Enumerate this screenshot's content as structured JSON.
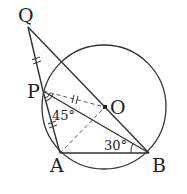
{
  "diagram": {
    "points": {
      "Q": {
        "label": "Q",
        "x": 28,
        "y": 27
      },
      "P": {
        "label": "P",
        "x": 43,
        "y": 91
      },
      "O": {
        "label": "O",
        "x": 105,
        "y": 107
      },
      "A": {
        "label": "A",
        "x": 60,
        "y": 153
      },
      "B": {
        "label": "B",
        "x": 149,
        "y": 153
      }
    },
    "circle": {
      "cx": 104,
      "cy": 107,
      "r": 62
    },
    "angles": {
      "angle_P": "45°",
      "angle_B": "30°"
    },
    "segments": {
      "solid": [
        "QP",
        "PA",
        "AB",
        "QB",
        "PB"
      ],
      "dashed": [
        "PO",
        "AO"
      ]
    },
    "tick_marks": [
      "QP",
      "PA",
      "PO"
    ],
    "colors": {
      "stroke": "#333333",
      "text": "#222222"
    }
  }
}
